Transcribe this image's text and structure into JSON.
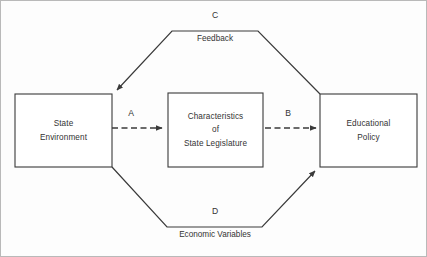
{
  "diagram": {
    "colors": {
      "stroke": "#3a3a3a",
      "text": "#333333",
      "background": "#fdfdfd",
      "box_fill": "#ffffff"
    },
    "nodes": [
      {
        "id": "state-environment",
        "lines": [
          "State",
          "Environment"
        ],
        "shape": "rectangle"
      },
      {
        "id": "characteristics-of-state-legislature",
        "lines": [
          "Characteristics",
          "of",
          "State Legislature"
        ],
        "shape": "rectangle"
      },
      {
        "id": "educational-policy",
        "lines": [
          "Educational",
          "Policy"
        ],
        "shape": "rectangle"
      }
    ],
    "edges": [
      {
        "id": "a",
        "letter": "A",
        "style": "dashed-arrow",
        "from": "state-environment",
        "to": "characteristics-of-state-legislature"
      },
      {
        "id": "b",
        "letter": "B",
        "style": "dashed-arrow",
        "from": "characteristics-of-state-legislature",
        "to": "educational-policy"
      },
      {
        "id": "c",
        "letter": "C",
        "label": "Feedback",
        "style": "solid-arrow",
        "from": "educational-policy",
        "to": "state-environment",
        "path": "upper"
      },
      {
        "id": "d",
        "letter": "D",
        "label": "Economic Variables",
        "style": "solid-arrow",
        "from": "state-environment",
        "to": "educational-policy",
        "path": "lower"
      }
    ]
  }
}
